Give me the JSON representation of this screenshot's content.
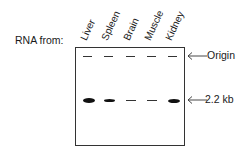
{
  "figure": {
    "row_label": "RNA from:",
    "lanes": [
      {
        "name": "Liver",
        "band_intensity": "strong"
      },
      {
        "name": "Spleen",
        "band_intensity": "medium"
      },
      {
        "name": "Brain",
        "band_intensity": "weak"
      },
      {
        "name": "Muscle",
        "band_intensity": "weak"
      },
      {
        "name": "Kidney",
        "band_intensity": "medium-strong"
      }
    ],
    "markers": {
      "origin": "Origin",
      "band": "2.2 kb"
    }
  }
}
